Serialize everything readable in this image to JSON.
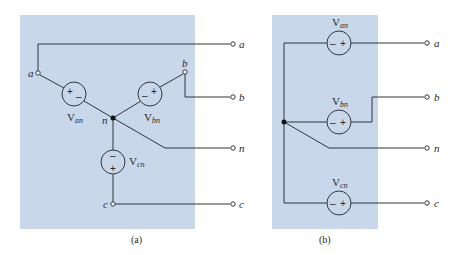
{
  "colors": {
    "panel_bg": "#c9d7ea",
    "wire": "#2f3640",
    "background": "#ffffff"
  },
  "panel_a": {
    "caption": "(a)",
    "title": "Wye-connected three-phase source",
    "nodes": {
      "a": "a",
      "b": "b",
      "n": "n",
      "c": "c"
    },
    "sources": [
      {
        "name": "V",
        "sub": "an",
        "polarity_left": "+",
        "polarity_right": "–"
      },
      {
        "name": "V",
        "sub": "bn",
        "polarity_left": "–",
        "polarity_right": "+"
      },
      {
        "name": "V",
        "sub": "cn",
        "polarity_top": "–",
        "polarity_bottom": "+"
      }
    ],
    "terminals": [
      "a",
      "b",
      "n",
      "c"
    ]
  },
  "panel_b": {
    "caption": "(b)",
    "title": "Equivalent circuit",
    "sources": [
      {
        "name": "V",
        "sub": "an",
        "polarity_left": "–",
        "polarity_right": "+"
      },
      {
        "name": "V",
        "sub": "bn",
        "polarity_left": "–",
        "polarity_right": "+"
      },
      {
        "name": "V",
        "sub": "cn",
        "polarity_left": "–",
        "polarity_right": "+"
      }
    ],
    "terminals": [
      "a",
      "b",
      "n",
      "c"
    ]
  }
}
